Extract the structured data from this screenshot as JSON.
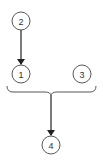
{
  "diagram": {
    "type": "flow",
    "nodes": [
      {
        "id": "n2",
        "label": "2",
        "cx": 21,
        "cy": 21,
        "r": 9
      },
      {
        "id": "n1",
        "label": "1",
        "cx": 21,
        "cy": 74,
        "r": 9
      },
      {
        "id": "n3",
        "label": "3",
        "cx": 82,
        "cy": 74,
        "r": 9
      },
      {
        "id": "n4",
        "label": "4",
        "cx": 51,
        "cy": 145,
        "r": 9
      }
    ],
    "edges": [
      {
        "from": "2",
        "to": "1"
      },
      {
        "from": "brace(1,3)",
        "to": "4"
      }
    ],
    "grouping": {
      "type": "curly-brace",
      "members": [
        "1",
        "3"
      ]
    },
    "colors": {
      "stroke": "#333333",
      "background": "#ffffff"
    }
  }
}
